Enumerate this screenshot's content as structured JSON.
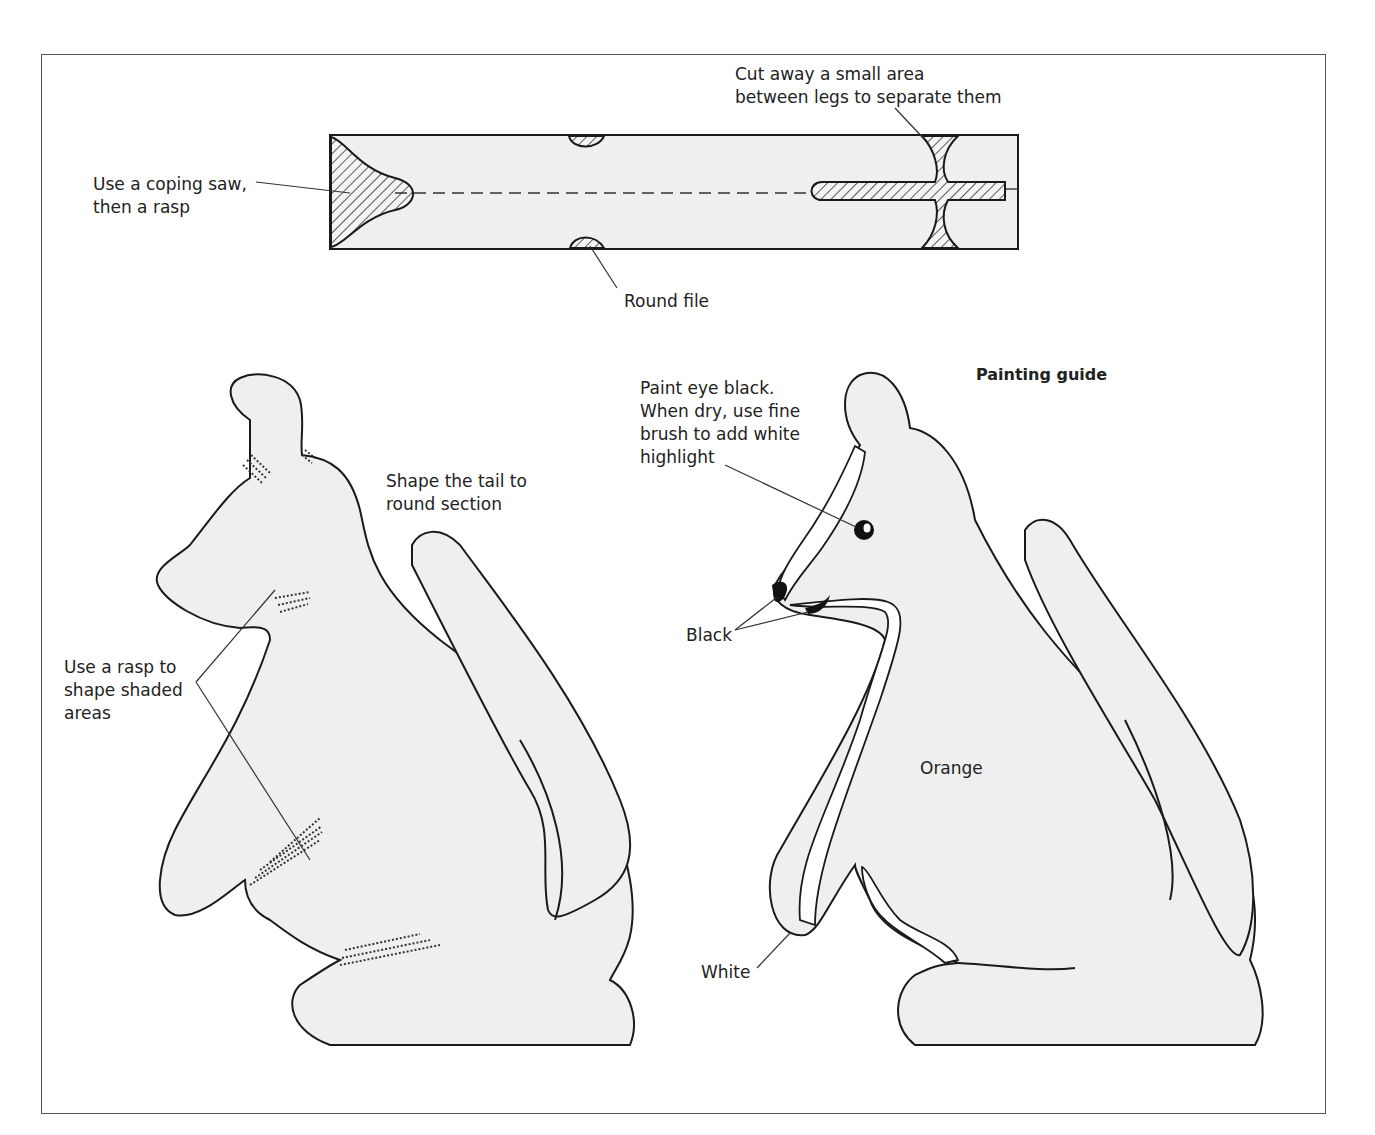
{
  "figure": {
    "colors": {
      "fill": "#efefef",
      "stroke": "#1a1a1a",
      "frame": "#555555",
      "text": "#222222",
      "hatch": "#333333"
    }
  },
  "blank_diagram": {
    "labels": {
      "coping_saw": "Use a coping saw,\nthen a rasp",
      "cut_away": "Cut away a small area\nbetween legs to separate them",
      "round_file": "Round file"
    }
  },
  "shaping_diagram": {
    "labels": {
      "tail": "Shape the tail to\nround section",
      "rasp": "Use a rasp to\nshape shaded\nareas"
    }
  },
  "painting_guide": {
    "title": "Painting guide",
    "labels": {
      "eye": "Paint eye black.\nWhen dry, use fine\nbrush to add white\nhighlight",
      "black": "Black",
      "orange": "Orange",
      "white": "White"
    }
  }
}
